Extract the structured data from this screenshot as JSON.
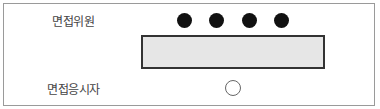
{
  "diagram": {
    "interviewers": {
      "label": "면접위원",
      "count": 4,
      "seat_color": "#111111"
    },
    "table": {
      "fill_color": "#e6e6e6",
      "border_color": "#333333"
    },
    "candidate": {
      "label": "면접응시자",
      "seat_style": "hollow-circle"
    }
  }
}
